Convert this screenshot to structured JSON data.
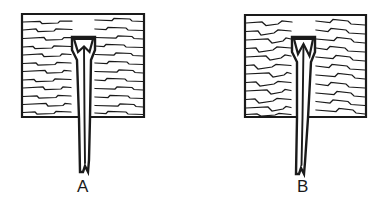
{
  "figure": {
    "background_color": "#ffffff",
    "ink_color": "#1a1a1a",
    "panels": [
      {
        "id": "A",
        "label": "A",
        "label_position": {
          "x": 83,
          "y": 192
        },
        "block": {
          "name": "wood-block",
          "x": 22,
          "y": 14,
          "width": 122,
          "height": 103,
          "grain_orientation": "horizontal",
          "grain_line_count": 13,
          "grain_style": "wavy-with-step-jogs"
        },
        "blade": {
          "name": "chisel-blade",
          "top_y": 37,
          "tip_y": 172,
          "center_x": 83,
          "notch_type": "wide-shallow-v",
          "notch_width": 22,
          "notch_depth": 16,
          "tip_split": true,
          "slant": "vertical"
        }
      },
      {
        "id": "B",
        "label": "B",
        "label_position": {
          "x": 303,
          "y": 192
        },
        "block": {
          "name": "wood-block",
          "x": 245,
          "y": 15,
          "width": 121,
          "height": 102,
          "grain_orientation": "horizontal",
          "grain_line_count": 13,
          "grain_style": "irregular-wavy-pronounced-jogs"
        },
        "blade": {
          "name": "chisel-blade",
          "top_y": 37,
          "tip_y": 174,
          "center_x": 303,
          "notch_type": "narrow-deep-v",
          "notch_width": 16,
          "notch_depth": 22,
          "tip_split": true,
          "slant": "leaning-left"
        }
      }
    ]
  }
}
